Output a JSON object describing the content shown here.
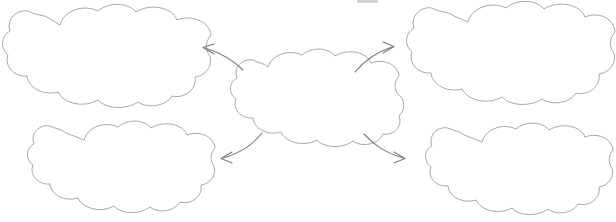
{
  "diagram": {
    "type": "concept-map",
    "title": "",
    "background_color": "#ffffff",
    "cloud_outline_color": "#9c9c9c",
    "arrow_color": "#7d7d7d",
    "cloud_fill_color": "#ffffff",
    "node_count": 5,
    "arrow_count": 4,
    "nodes": [
      {
        "id": "center",
        "name": "center-cloud",
        "label": "",
        "position": "center",
        "cx": 309,
        "cy": 100,
        "rx": 99,
        "ry": 48
      },
      {
        "id": "top-left",
        "name": "top-left-cloud",
        "label": "",
        "position": "top-left",
        "cx": 101,
        "cy": 57,
        "rx": 99,
        "ry": 48
      },
      {
        "id": "top-right",
        "name": "top-right-cloud",
        "label": "",
        "position": "top-right",
        "cx": 508,
        "cy": 55,
        "rx": 99,
        "ry": 48
      },
      {
        "id": "bottom-left",
        "name": "bottom-left-cloud",
        "label": "",
        "position": "bottom-left",
        "cx": 122,
        "cy": 170,
        "rx": 93,
        "ry": 46
      },
      {
        "id": "bottom-right",
        "name": "bottom-right-cloud",
        "label": "",
        "position": "bottom-right",
        "cx": 520,
        "cy": 172,
        "rx": 93,
        "ry": 46
      }
    ],
    "arrows": [
      {
        "id": "arrow-center-to-top-left",
        "name": "arrow-center-to-top-left",
        "from": "center",
        "to": "top-left",
        "direction": "up-left",
        "label": ""
      },
      {
        "id": "arrow-center-to-top-right",
        "name": "arrow-center-to-top-right",
        "from": "center",
        "to": "top-right",
        "direction": "up-right",
        "label": ""
      },
      {
        "id": "arrow-center-to-bottom-left",
        "name": "arrow-center-to-bottom-left",
        "from": "center",
        "to": "bottom-left",
        "direction": "down-left",
        "label": ""
      },
      {
        "id": "arrow-center-to-bottom-right",
        "name": "arrow-center-to-bottom-right",
        "from": "center",
        "to": "bottom-right",
        "direction": "down-right",
        "label": ""
      }
    ]
  }
}
